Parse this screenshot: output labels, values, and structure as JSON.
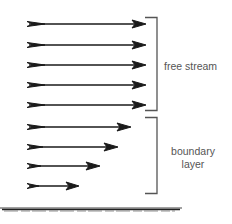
{
  "diagram": {
    "colors": {
      "arrow": "#1a1a1a",
      "bracket": "#555555",
      "label": "#555555",
      "surface": "#333333"
    },
    "regions": [
      {
        "name": "free stream",
        "label_lines": [
          "free stream"
        ]
      },
      {
        "name": "boundary layer",
        "label_lines": [
          "boundary",
          "layer"
        ]
      }
    ],
    "arrows": [
      {
        "region": "free stream",
        "y": 24,
        "x_start": 27,
        "x_end": 145
      },
      {
        "region": "free stream",
        "y": 45,
        "x_start": 27,
        "x_end": 145
      },
      {
        "region": "free stream",
        "y": 65,
        "x_start": 27,
        "x_end": 145
      },
      {
        "region": "free stream",
        "y": 85,
        "x_start": 27,
        "x_end": 145
      },
      {
        "region": "free stream",
        "y": 105,
        "x_start": 27,
        "x_end": 145
      },
      {
        "region": "boundary layer",
        "y": 127,
        "x_start": 27,
        "x_end": 130
      },
      {
        "region": "boundary layer",
        "y": 147,
        "x_start": 27,
        "x_end": 117
      },
      {
        "region": "boundary layer",
        "y": 166,
        "x_start": 27,
        "x_end": 99
      },
      {
        "region": "boundary layer",
        "y": 186,
        "x_start": 27,
        "x_end": 78
      }
    ],
    "surface": {
      "label": "",
      "y": 209
    }
  }
}
